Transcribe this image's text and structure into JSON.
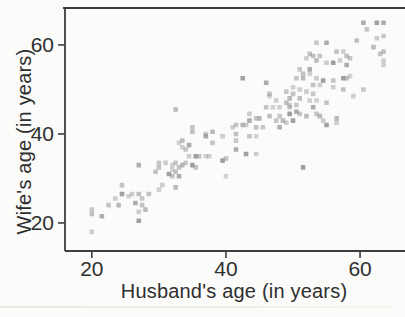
{
  "figure": {
    "background": "#fbfbfa",
    "frame_color": "#3d3d3d",
    "text_color": "#2f2f2f"
  },
  "chart_data": {
    "type": "scatter",
    "title": "",
    "xlabel": "Husband's age (in years)",
    "ylabel": "Wife's age (in years)",
    "xlim": [
      16,
      66.7
    ],
    "ylim": [
      13.7,
      68.3
    ],
    "x_ticks": [
      20,
      40,
      60
    ],
    "y_ticks": [
      20,
      40,
      60
    ],
    "grid": false,
    "legend": "none",
    "marker": "square",
    "marker_color": "#8f8f8f",
    "points_format": "[husband_age, wife_age]",
    "points": [
      [
        20,
        18
      ],
      [
        20,
        22
      ],
      [
        20,
        23
      ],
      [
        21.5,
        21.5
      ],
      [
        22.5,
        24
      ],
      [
        24,
        24
      ],
      [
        23.5,
        25.5
      ],
      [
        24.5,
        26.5
      ],
      [
        24.5,
        28.5
      ],
      [
        25.5,
        26
      ],
      [
        26,
        26.5
      ],
      [
        27,
        26.5
      ],
      [
        27.5,
        25.5
      ],
      [
        26.5,
        24.5
      ],
      [
        27.5,
        24
      ],
      [
        28,
        23
      ],
      [
        27,
        22.5
      ],
      [
        27,
        20.5
      ],
      [
        28.5,
        26.5
      ],
      [
        30,
        27.5
      ],
      [
        30.5,
        28.5
      ],
      [
        29.5,
        31.5
      ],
      [
        30,
        33.5
      ],
      [
        27,
        33
      ],
      [
        30,
        32.5
      ],
      [
        32.5,
        28
      ],
      [
        31,
        33.5
      ],
      [
        31.5,
        31
      ],
      [
        32,
        30.5
      ],
      [
        32,
        32
      ],
      [
        32,
        33
      ],
      [
        32.5,
        31.5
      ],
      [
        32.5,
        33.5
      ],
      [
        33,
        30.5
      ],
      [
        33,
        32.5
      ],
      [
        33.5,
        33
      ],
      [
        34,
        33.5
      ],
      [
        35,
        33
      ],
      [
        35.5,
        32.5
      ],
      [
        33,
        38
      ],
      [
        33.5,
        37
      ],
      [
        33.5,
        38.5
      ],
      [
        34,
        36.5
      ],
      [
        34.5,
        37.5
      ],
      [
        35,
        41.5
      ],
      [
        32.5,
        45.5
      ],
      [
        34.5,
        35
      ],
      [
        35.5,
        35
      ],
      [
        36,
        35
      ],
      [
        37,
        35
      ],
      [
        37.5,
        35
      ],
      [
        35,
        40.5
      ],
      [
        37,
        40
      ],
      [
        37,
        39.5
      ],
      [
        38,
        38
      ],
      [
        38,
        40.5
      ],
      [
        39.5,
        39.5
      ],
      [
        39.5,
        34
      ],
      [
        40,
        34.5
      ],
      [
        40,
        30.5
      ],
      [
        41,
        41.5
      ],
      [
        41.5,
        40
      ],
      [
        41.5,
        38.5
      ],
      [
        41.5,
        36.5
      ],
      [
        41.5,
        42
      ],
      [
        42.5,
        42
      ],
      [
        43,
        42
      ],
      [
        43,
        35.5
      ],
      [
        43.5,
        39.5
      ],
      [
        44.5,
        39.5
      ],
      [
        44.5,
        35.5
      ],
      [
        44.5,
        41.5
      ],
      [
        45.5,
        41.5
      ],
      [
        43.5,
        43
      ],
      [
        44.5,
        43.5
      ],
      [
        45,
        43.5
      ],
      [
        43.5,
        44.5
      ],
      [
        42.5,
        52.5
      ],
      [
        46,
        46
      ],
      [
        47,
        46
      ],
      [
        48,
        46
      ],
      [
        46.5,
        44
      ],
      [
        48,
        44
      ],
      [
        48,
        41.5
      ],
      [
        47.5,
        43
      ],
      [
        48.5,
        43
      ],
      [
        49,
        42.5
      ],
      [
        49.5,
        44.5
      ],
      [
        49.5,
        46
      ],
      [
        46.5,
        48.5
      ],
      [
        47.5,
        47.5
      ],
      [
        49,
        47
      ],
      [
        49,
        49.5
      ],
      [
        46,
        51.5
      ],
      [
        46.5,
        49
      ],
      [
        49.5,
        48
      ],
      [
        49.5,
        46.5
      ],
      [
        50,
        43
      ],
      [
        50,
        49
      ],
      [
        50,
        50.5
      ],
      [
        51,
        50
      ],
      [
        51,
        48
      ],
      [
        50.5,
        46.5
      ],
      [
        50.5,
        45
      ],
      [
        51,
        44.5
      ],
      [
        52,
        44
      ],
      [
        52,
        49.5
      ],
      [
        51.5,
        32.5
      ],
      [
        51.5,
        53.5
      ],
      [
        52.5,
        53.5
      ],
      [
        52,
        57
      ],
      [
        53,
        57.5
      ],
      [
        53,
        49
      ],
      [
        53,
        46
      ],
      [
        53.5,
        44.5
      ],
      [
        54,
        44
      ],
      [
        54.5,
        43
      ],
      [
        55,
        42
      ],
      [
        55,
        47
      ],
      [
        53.5,
        47.5
      ],
      [
        52.5,
        47.5
      ],
      [
        52.5,
        58
      ],
      [
        53.5,
        60.5
      ],
      [
        55,
        60.5
      ],
      [
        54,
        57.5
      ],
      [
        53.5,
        56.5
      ],
      [
        55,
        56
      ],
      [
        56,
        56
      ],
      [
        56.5,
        58.5
      ],
      [
        57.5,
        58.5
      ],
      [
        57,
        56.5
      ],
      [
        58,
        57.5
      ],
      [
        58.5,
        57
      ],
      [
        58,
        55.5
      ],
      [
        56,
        52
      ],
      [
        56.5,
        43.5
      ],
      [
        56.5,
        42.5
      ],
      [
        57.5,
        52.5
      ],
      [
        58,
        52.5
      ],
      [
        58.5,
        53
      ],
      [
        56,
        50.5
      ],
      [
        57.5,
        50
      ],
      [
        51,
        54.5
      ],
      [
        52.5,
        54.5
      ],
      [
        50.5,
        52.5
      ],
      [
        51.5,
        52.5
      ],
      [
        53.5,
        52.5
      ],
      [
        54.5,
        52
      ],
      [
        53,
        51
      ],
      [
        54,
        51
      ],
      [
        59,
        48.5
      ],
      [
        59.5,
        61
      ],
      [
        60.5,
        50
      ],
      [
        60.5,
        65
      ],
      [
        61,
        63.5
      ],
      [
        62,
        59.5
      ],
      [
        62.5,
        61.5
      ],
      [
        62.5,
        65
      ],
      [
        63,
        58
      ],
      [
        63.5,
        55.5
      ],
      [
        63.5,
        56.5
      ],
      [
        63.5,
        58.5
      ],
      [
        63.5,
        62
      ],
      [
        63.5,
        65
      ]
    ]
  }
}
